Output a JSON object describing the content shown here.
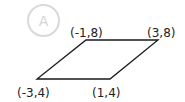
{
  "option": {
    "label": "A",
    "color": "#d9d9d9"
  },
  "figure": {
    "shape": "parallelogram",
    "stroke_color": "#1a1a1a",
    "vertices": [
      {
        "label": "(-1,8)",
        "x": -1,
        "y": 8
      },
      {
        "label": "(3,8)",
        "x": 3,
        "y": 8
      },
      {
        "label": "(1,4)",
        "x": 1,
        "y": 4
      },
      {
        "label": "(-3,4)",
        "x": -3,
        "y": 4
      }
    ]
  }
}
